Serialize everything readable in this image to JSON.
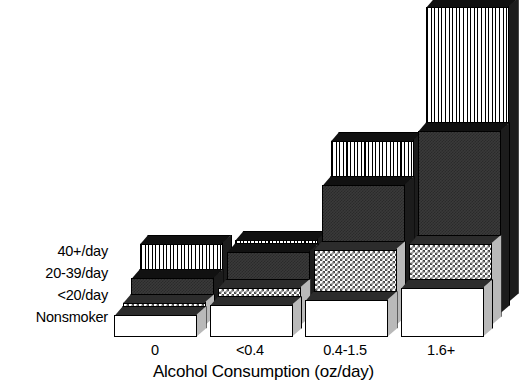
{
  "chart_data": {
    "type": "bar",
    "title": "",
    "subtitle": "",
    "xlabel": "Alcohol Consumption (oz/day)",
    "ylabel": "",
    "categories": [
      "0",
      "<0.4",
      "0.4-1.5",
      "1.6+"
    ],
    "series": [
      {
        "name": "Nonsmoker",
        "fill": "solid-white",
        "values": [
          22,
          32,
          37,
          49
        ]
      },
      {
        "name": "<20/day",
        "fill": "checkerboard-gray",
        "values": [
          23,
          38,
          76,
          82
        ]
      },
      {
        "name": "20-39/day",
        "fill": "solid-dark-gray",
        "values": [
          36,
          62,
          129,
          183
        ]
      },
      {
        "name": "40+/day",
        "fill": "vertical-stripes",
        "values": [
          59,
          63,
          162,
          296
        ]
      }
    ],
    "series_order_note": "front-to-back",
    "grid": false,
    "legend_position": "left-row-labels",
    "y_axis_visible": false,
    "y_tick_labels": [],
    "projection": "3d-isometric",
    "colors": {
      "outline": "#000000",
      "background": "#ffffff",
      "nonsmoker": "#ffffff",
      "under20": "#9a9a9a",
      "twenty_thirtynine": "#3a3a3a",
      "fortyplus": "#c8c8c8",
      "side_face": "#b9b9b9",
      "top_face": "#111111"
    }
  },
  "series_labels": [
    {
      "label": "40+/day"
    },
    {
      "label": "20-39/day"
    },
    {
      "label": "<20/day"
    },
    {
      "label": "Nonsmoker"
    }
  ],
  "axis": {
    "x_title": "Alcohol Consumption (oz/day)",
    "x_ticks": [
      "0",
      "<0.4",
      "0.4-1.5",
      "1.6+"
    ]
  }
}
